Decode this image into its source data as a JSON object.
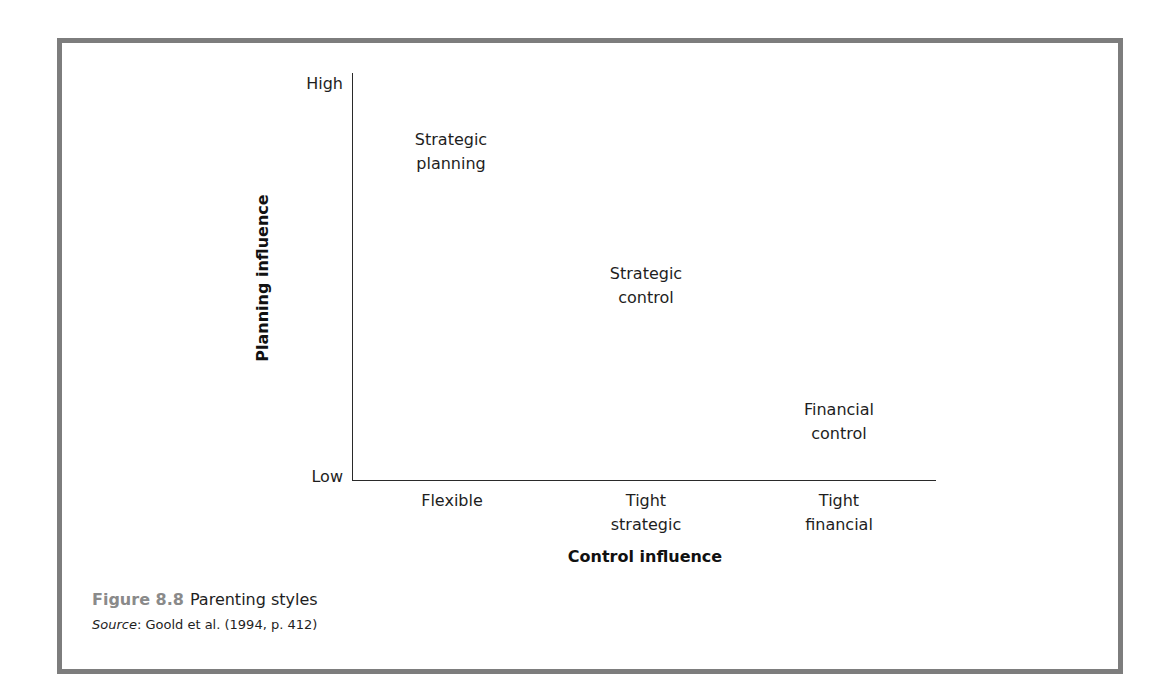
{
  "figure": {
    "number": "Figure 8.8",
    "title": "Parenting styles",
    "source_label": "Source",
    "source_text": ": Goold et al. (1994, p. 412)",
    "frame_color": "#7d7d7d",
    "number_color": "#8a8a8a"
  },
  "axes": {
    "y_title": "Planning influence",
    "x_title": "Control influence",
    "y_high": "High",
    "y_low": "Low",
    "x_categories": [
      {
        "line1": "Flexible",
        "line2": ""
      },
      {
        "line1": "Tight",
        "line2": "strategic"
      },
      {
        "line1": "Tight",
        "line2": "financial"
      }
    ]
  },
  "regions": [
    {
      "line1": "Strategic",
      "line2": "planning"
    },
    {
      "line1": "Strategic",
      "line2": "control"
    },
    {
      "line1": "Financial",
      "line2": "control"
    }
  ]
}
